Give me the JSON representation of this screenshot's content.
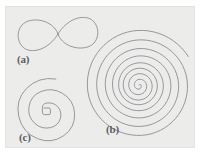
{
  "figure": {
    "background_color": "#ffffff",
    "panel_color": "#ececeb",
    "panel_border_color": "#e2e2e1",
    "curve_color": "#8d8d93",
    "label_color": "#5d5d62",
    "panel": {
      "x": 5,
      "y": 6,
      "width": 190,
      "height": 142
    }
  },
  "labels": {
    "a": "(a)",
    "b": "(b)",
    "c": "(c)"
  },
  "chart_data": {
    "type": "line",
    "subtitle": "",
    "xlabel": "",
    "ylabel": "",
    "grid": false,
    "legend_position": "none",
    "axis_visible": false,
    "xlim": [
      0,
      190
    ],
    "ylim": [
      0,
      142
    ],
    "annotations": [
      {
        "text": "(a)",
        "x": 11,
        "y": 47
      },
      {
        "text": "(b)",
        "x": 100,
        "y": 117
      },
      {
        "text": "(c)",
        "x": 13,
        "y": 125
      }
    ],
    "series": [
      {
        "name": "(a) lemniscate",
        "label": "(a)",
        "curve_type": "lemniscate",
        "stroke": "#8d8d93",
        "stroke_width": 0.9,
        "description": "figure-eight curve with two lobes crossing at the middle",
        "center": [
          52,
          27
        ],
        "half_width": 40,
        "lobe_height": 17,
        "crossing_point": [
          52,
          27
        ],
        "x_range": [
          12,
          92
        ],
        "y_range": [
          10,
          44
        ],
        "path": "M 52 27 C 47 12 24 9 16 18 C 9 26 12 40 22 43 C 34 46 46 37 52 27 C 58 17 70 8 82 11 C 92 14 95 28 88 36 C 80 45 57 42 52 27 Z"
      },
      {
        "name": "(b) logarithmic spiral",
        "label": "(b)",
        "curve_type": "logarithmic-spiral",
        "stroke": "#8d8d93",
        "stroke_width": 0.9,
        "description": "wide outward logarithmic spiral, roughly 2.5 turns, opening counter-clockwise",
        "center": [
          133,
          78
        ],
        "growth_rate": 0.22,
        "turns": 2.6,
        "max_radius": 60,
        "x_range": [
          73,
          190
        ],
        "y_range": [
          6,
          138
        ],
        "path": "M 133.0 78.0 C 133.5 77.1 134.4 77.1 134.9 77.9 C 135.6 79.0 135.3 80.6 134.2 81.5 C 132.7 82.7 130.4 82.2 129.2 80.4 C 127.7 78.1 128.4 74.9 130.7 73.3 C 133.5 71.4 137.5 72.3 139.5 75.3 C 141.8 78.9 140.6 83.9 136.9 86.3 C 132.7 89.0 126.9 87.5 124.2 83.1 C 121.2 78.2 122.9 71.5 127.8 68.4 C 133.3 64.9 140.8 66.9 144.3 72.5 C 148.1 78.7 145.9 87.0 139.7 90.9 C 132.9 95.2 123.8 92.8 119.5 85.9 C 114.9 78.4 117.5 68.4 125.0 63.7 C 133.0 58.7 143.7 61.5 148.7 69.6 C 154.0 78.1 151.0 89.5 142.5 94.9 C 133.5 100.6 121.4 97.4 115.7 88.2 C 109.6 78.4 113.0 65.3 122.8 59.1 C 133.2 52.5 147.2 56.1 153.8 66.6 C 160.8 77.7 157.0 92.6 145.9 99.8 C 134.1 107.4 118.2 103.4 110.6 91.4 C 102.5 78.6 106.8 61.5 119.6 53.3 C 133.2 44.6 151.5 49.2 160.2 62.8 C 169.4 77.2 164.5 96.6 150.1 105.9 C 134.9 115.7 114.4 110.6 104.6 95.4 C 94.2 79.2 99.6 57.4 115.8 47.1 C 132.9 36.2 155.9 41.9 166.8 59.1 C 178.3 77.2 172.2 101.6 154.1 113.2 C 135.0 125.4 109.4 119.0 97.2 99.9 C 84.4 79.7 91.1 52.5 111.3 39.7 C 132.4 26.3 160.9 33.3 174.3 54.5 C 188.4 76.7 181.0 106.6 158.8 120.8 C 135.5 135.7 104.2 128.0 89.3 104.6 C 73.7 80.1 81.8 47.4 106.3 31.7 C 131.9 15.4 166.1 23.9 182.3 49.5"
      },
      {
        "name": "(c) tight spiral",
        "label": "(c)",
        "curve_type": "spiral-with-square-core",
        "stroke": "#8d8d93",
        "stroke_width": 0.9,
        "description": "spiral of about 2.5 turns winding into a small rounded-square core on the left side",
        "center": [
          41,
          103
        ],
        "core_shape": "small rounded square",
        "core_size": 6,
        "turns": 2.5,
        "max_radius": 34,
        "x_range": [
          7,
          77
        ],
        "y_range": [
          69,
          140
        ],
        "path": "M 38.0 101.0 L 43.0 101.0 Q 44.4 101.0 44.4 102.4 L 44.4 106.2 Q 44.4 107.6 43.0 107.6 L 38.6 107.6 Q 36.4 107.6 36.4 105.2 L 36.4 100.8 Q 36.4 96.6 40.8 96.0 Q 47.6 95.2 51.6 99.6 Q 56.2 104.6 54.4 111.4 Q 52.4 118.8 44.6 120.6 Q 35.6 122.6 28.8 116.4 Q 21.4 109.6 23.0 99.6 Q 24.7 88.8 34.8 84.6 Q 46.0 80.0 56.6 86.4 Q 68.0 93.3 68.6 106.6 Q 69.2 120.6 57.8 128.6 Q 45.4 137.3 31.4 131.6 Q 16.4 125.5 12.8 109.6 Q 9.1 93.0 20.6 81.4 Q 32.6 69.3 49.8 72.0"
      }
    ]
  }
}
